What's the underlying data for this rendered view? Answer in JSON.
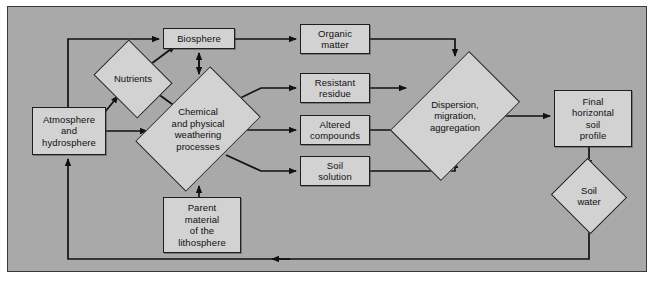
{
  "diagram": {
    "background_color": "#a9a9a9",
    "node_fill_color": "#d2d2d2",
    "line_color": "#111111",
    "nodes": [
      {
        "id": "biosphere",
        "shape": "rect",
        "label": "Biosphere",
        "x": 163,
        "y": 28,
        "w": 72,
        "h": 21
      },
      {
        "id": "nutrients",
        "shape": "diamond",
        "label": "Nutrients",
        "cx": 133,
        "cy": 79,
        "w": 62,
        "h": 50
      },
      {
        "id": "atmosphere",
        "shape": "rect",
        "label": "Atmosphere\nand\nhydrosphere",
        "x": 32,
        "y": 107,
        "w": 74,
        "h": 48
      },
      {
        "id": "weathering",
        "shape": "diamond",
        "label": "Chemical\nand physical\nweathering\nprocesses",
        "cx": 198,
        "cy": 129,
        "w": 94,
        "h": 106
      },
      {
        "id": "parent",
        "shape": "rect",
        "label": "Parent\nmaterial\nof the\nlithosphere",
        "x": 163,
        "y": 197,
        "w": 78,
        "h": 56
      },
      {
        "id": "organic",
        "shape": "rect",
        "label": "Organic\nmatter",
        "x": 300,
        "y": 24,
        "w": 70,
        "h": 30
      },
      {
        "id": "resistant",
        "shape": "rect",
        "label": "Resistant\nresidue",
        "x": 300,
        "y": 73,
        "w": 70,
        "h": 30
      },
      {
        "id": "altered",
        "shape": "rect",
        "label": "Altered\ncompounds",
        "x": 300,
        "y": 115,
        "w": 70,
        "h": 30
      },
      {
        "id": "soilsol",
        "shape": "rect",
        "label": "Soil\nsolution",
        "x": 300,
        "y": 156,
        "w": 70,
        "h": 30
      },
      {
        "id": "dispersion",
        "shape": "diamond",
        "label": "Dispersion,\nmigration,\naggregation",
        "cx": 455,
        "cy": 116,
        "w": 90,
        "h": 112
      },
      {
        "id": "finalsoil",
        "shape": "rect",
        "label": "Final\nhorizontal\nsoil\nprofile",
        "x": 554,
        "y": 90,
        "w": 78,
        "h": 57
      },
      {
        "id": "soilwater",
        "shape": "diamond",
        "label": "Soil\nwater",
        "cx": 589,
        "cy": 196,
        "w": 56,
        "h": 52
      }
    ],
    "edges": [
      {
        "from": "atmosphere",
        "to": "biosphere",
        "style": "orthogonal-up-right"
      },
      {
        "from": "atmosphere",
        "to": "nutrients",
        "style": "diagonal"
      },
      {
        "from": "atmosphere",
        "to": "weathering",
        "style": "straight-right"
      },
      {
        "from": "nutrients",
        "to": "biosphere",
        "style": "diagonal"
      },
      {
        "from": "weathering",
        "to": "nutrients",
        "style": "diagonal"
      },
      {
        "from": "weathering",
        "to": "biosphere",
        "style": "vertical-double"
      },
      {
        "from": "parent",
        "to": "weathering",
        "style": "vertical-up"
      },
      {
        "from": "biosphere",
        "to": "organic",
        "style": "straight-right"
      },
      {
        "from": "weathering",
        "to": "resistant",
        "style": "orthogonal-right"
      },
      {
        "from": "weathering",
        "to": "altered",
        "style": "straight-right"
      },
      {
        "from": "weathering",
        "to": "soilsol",
        "style": "orthogonal-right"
      },
      {
        "from": "organic",
        "to": "dispersion",
        "style": "orthogonal-right-down"
      },
      {
        "from": "resistant",
        "to": "dispersion",
        "style": "straight-right"
      },
      {
        "from": "altered",
        "to": "dispersion",
        "style": "straight-right"
      },
      {
        "from": "soilsol",
        "to": "dispersion",
        "style": "orthogonal-right-up"
      },
      {
        "from": "dispersion",
        "to": "finalsoil",
        "style": "straight-right"
      },
      {
        "from": "finalsoil",
        "to": "soilwater",
        "style": "vertical-down"
      },
      {
        "from": "soilwater",
        "to": "atmosphere",
        "style": "feedback-loop-bottom"
      }
    ]
  }
}
